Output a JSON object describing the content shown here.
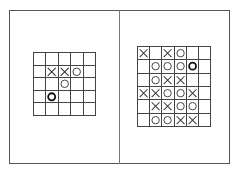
{
  "caption": "",
  "panels": [
    {
      "label": "",
      "rows": 5,
      "cols": 5,
      "board": [
        [
          "",
          "",
          "",
          "",
          ""
        ],
        [
          "",
          "X",
          "X",
          "O",
          ""
        ],
        [
          "",
          "",
          "O",
          "",
          ""
        ],
        [
          "",
          "O*",
          "",
          "",
          ""
        ],
        [
          "",
          "",
          "",
          "",
          ""
        ]
      ]
    },
    {
      "label": "",
      "rows": 6,
      "cols": 6,
      "board": [
        [
          "X",
          "",
          "X",
          "O",
          "",
          ""
        ],
        [
          "",
          "O",
          "O",
          "O",
          "O*",
          ""
        ],
        [
          "",
          "O",
          "X",
          "X",
          "",
          ""
        ],
        [
          "X",
          "X",
          "O",
          "O",
          "X",
          ""
        ],
        [
          "",
          "X",
          "X",
          "O",
          "O",
          ""
        ],
        [
          "",
          "O",
          "O",
          "X",
          "X",
          ""
        ]
      ]
    }
  ],
  "legend": {
    "X": "x-mark",
    "O": "o-mark",
    "O*": "o-mark-highlighted (last move)"
  },
  "colors": {
    "line": "#444444",
    "mark": "#333333",
    "highlight": "#111111"
  }
}
